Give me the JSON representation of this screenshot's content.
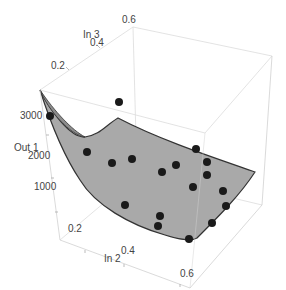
{
  "chart_data": {
    "type": "scatter3d_surface",
    "title": "",
    "axes": {
      "x": {
        "label": "In 2",
        "ticks": [
          "0.2",
          "0.4",
          "0.6"
        ],
        "range": [
          0.1,
          0.65
        ]
      },
      "y": {
        "label": "In 3",
        "ticks": [
          "0.2",
          "0.4",
          "0.6"
        ],
        "range": [
          0.1,
          0.65
        ]
      },
      "z": {
        "label": "Out 1",
        "ticks": [
          "1000",
          "2000",
          "3000"
        ],
        "range": [
          500,
          3400
        ]
      }
    },
    "surface": {
      "description": "fitted surface, decreasing steeply in Out 1 as In 2 and In 3 increase, concave up",
      "color": "#a9a9a9",
      "edge_color": "#333333"
    },
    "points_color": "#1a1a1a",
    "box": {
      "visible": true,
      "color": "#d8d8d8"
    },
    "grid": false,
    "legend": null
  },
  "labels": {
    "y_axis_title": "In 3",
    "y_ticks": [
      "0.2",
      "0.4",
      "0.6"
    ],
    "z_axis_title": "Out 1",
    "z_ticks": [
      "3000",
      "2000",
      "1000"
    ],
    "x_axis_title": "In 2",
    "x_ticks": [
      "0.2",
      "0.4",
      "0.6"
    ]
  },
  "screen_points": [
    [
      50,
      116
    ],
    [
      119,
      102
    ],
    [
      87,
      152
    ],
    [
      112,
      163
    ],
    [
      132,
      159
    ],
    [
      162,
      172
    ],
    [
      176,
      165
    ],
    [
      196,
      149
    ],
    [
      207,
      162
    ],
    [
      207,
      175
    ],
    [
      223,
      191
    ],
    [
      193,
      187
    ],
    [
      160,
      216
    ],
    [
      125,
      205
    ],
    [
      212,
      223
    ],
    [
      226,
      206
    ],
    [
      189,
      239
    ],
    [
      158,
      226
    ]
  ]
}
